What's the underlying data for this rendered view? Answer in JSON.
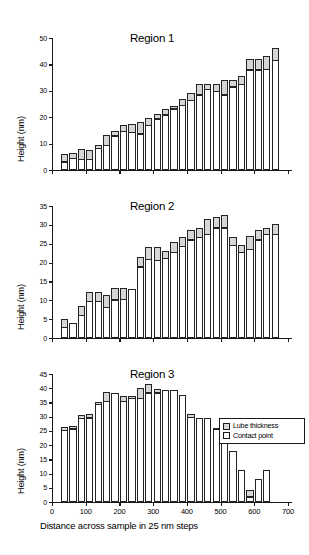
{
  "figure": {
    "xtitle": "Distance across sample in 25 nm steps",
    "ytitle": "Height (nm)",
    "legend": {
      "items": [
        {
          "label": "Lube thickness",
          "color": "#d6d6d6"
        },
        {
          "label": "Contact point",
          "color": "#ffffff"
        }
      ]
    }
  },
  "chart_data": [
    {
      "type": "bar",
      "title": "Region 1",
      "xlabel": "Distance across sample in 25 nm steps",
      "ylabel": "Height (nm)",
      "xlim": [
        0,
        700
      ],
      "ylim": [
        0,
        50
      ],
      "yticks": [
        0,
        10,
        20,
        30,
        40,
        50
      ],
      "xticks": [
        0,
        100,
        200,
        300,
        400,
        500,
        600,
        700
      ],
      "grid": false,
      "stacked": true,
      "legend_position": "none",
      "x": [
        37,
        62,
        87,
        112,
        137,
        162,
        187,
        212,
        237,
        262,
        287,
        312,
        337,
        362,
        387,
        412,
        437,
        462,
        487,
        512,
        537,
        562,
        587,
        612,
        637,
        662
      ],
      "series": [
        {
          "name": "Contact point",
          "values": [
            3.2,
            4.5,
            4.2,
            4.2,
            8.3,
            9.5,
            13.0,
            14.8,
            14.3,
            13.8,
            17.0,
            19.5,
            21.0,
            23.2,
            24.5,
            26.5,
            28.5,
            30.5,
            29.8,
            28.5,
            31.5,
            32.5,
            38.0,
            38.0,
            38.2,
            41.5
          ]
        },
        {
          "name": "Lube thickness",
          "values": [
            2.6,
            1.6,
            3.4,
            3.3,
            1.0,
            3.5,
            1.5,
            2.2,
            2.8,
            4.2,
            2.5,
            1.5,
            1.8,
            0.8,
            2.2,
            2.3,
            4.0,
            2.0,
            2.7,
            5.4,
            2.5,
            3.0,
            4.0,
            4.0,
            4.9,
            4.6
          ]
        }
      ],
      "totals": [
        5.8,
        6.1,
        7.6,
        7.5,
        9.3,
        13.0,
        14.5,
        17.0,
        17.1,
        18.0,
        19.5,
        21.0,
        22.8,
        24.0,
        26.7,
        28.8,
        32.5,
        32.5,
        32.5,
        33.9,
        34.0,
        35.5,
        42.0,
        42.0,
        43.1,
        46.1
      ]
    },
    {
      "type": "bar",
      "title": "Region 2",
      "xlabel": "Distance across sample in 25 nm steps",
      "ylabel": "Height (nm)",
      "xlim": [
        0,
        700
      ],
      "ylim": [
        0,
        35
      ],
      "yticks": [
        0,
        5,
        10,
        15,
        20,
        25,
        30,
        35
      ],
      "xticks": [
        0,
        100,
        200,
        300,
        400,
        500,
        600,
        700
      ],
      "grid": false,
      "stacked": true,
      "legend_position": "none",
      "x": [
        37,
        62,
        87,
        112,
        137,
        162,
        187,
        212,
        237,
        262,
        287,
        312,
        337,
        362,
        387,
        412,
        437,
        462,
        487,
        512,
        537,
        562,
        587,
        612,
        637,
        662
      ],
      "series": [
        {
          "name": "Contact point",
          "values": [
            2.9,
            4.0,
            6.0,
            9.8,
            9.7,
            8.2,
            10.2,
            10.3,
            13.0,
            18.9,
            20.9,
            20.6,
            21.2,
            22.8,
            24.3,
            26.1,
            26.7,
            27.5,
            29.2,
            29.2,
            24.6,
            22.8,
            23.5,
            26.1,
            27.6,
            27.6
          ]
        },
        {
          "name": "Lube thickness",
          "values": [
            2.1,
            0.0,
            2.4,
            2.2,
            2.4,
            3.0,
            2.8,
            2.7,
            0.0,
            2.5,
            3.2,
            3.5,
            1.6,
            2.5,
            2.4,
            2.4,
            2.2,
            3.8,
            2.6,
            3.2,
            2.1,
            1.6,
            3.5,
            2.5,
            1.3,
            2.6
          ]
        }
      ],
      "totals": [
        5.0,
        4.0,
        8.4,
        12.0,
        12.1,
        11.2,
        13.0,
        13.0,
        13.0,
        21.4,
        24.1,
        24.1,
        22.8,
        25.3,
        26.7,
        28.5,
        28.9,
        31.3,
        31.8,
        32.4,
        26.7,
        24.4,
        27.0,
        28.6,
        28.9,
        30.2
      ]
    },
    {
      "type": "bar",
      "title": "Region 3",
      "xlabel": "Distance across sample in 25 nm steps",
      "ylabel": "Height (nm)",
      "xlim": [
        0,
        700
      ],
      "ylim": [
        0,
        45
      ],
      "yticks": [
        0,
        5,
        10,
        15,
        20,
        25,
        30,
        35,
        40,
        45
      ],
      "xticks": [
        0,
        100,
        200,
        300,
        400,
        500,
        600,
        700
      ],
      "grid": false,
      "stacked": true,
      "legend_position": "upper right",
      "x": [
        37,
        62,
        87,
        112,
        137,
        162,
        187,
        212,
        237,
        262,
        287,
        312,
        337,
        362,
        387,
        412,
        437,
        462,
        487,
        512,
        537,
        562,
        587,
        612,
        637
      ],
      "series": [
        {
          "name": "Contact point",
          "values": [
            25.3,
            25.8,
            29.4,
            29.6,
            34.3,
            35.5,
            38.4,
            35.4,
            36.6,
            36.4,
            38.5,
            38.4,
            39.5,
            39.5,
            37.5,
            29.9,
            29.6,
            29.4,
            25.5,
            23.5,
            17.9,
            11.4,
            1.8,
            8.2,
            11.2
          ]
        },
        {
          "name": "Lube thickness",
          "values": [
            1.0,
            0.7,
            0.9,
            1.2,
            0.6,
            3.0,
            0.0,
            1.5,
            0.5,
            3.3,
            2.9,
            1.2,
            0.0,
            0.0,
            0.0,
            1.0,
            0.0,
            0.0,
            0.3,
            0.2,
            0.0,
            0.0,
            2.2,
            0.0,
            0.0
          ]
        }
      ],
      "totals": [
        26.3,
        26.5,
        30.3,
        30.8,
        34.9,
        38.5,
        38.4,
        36.9,
        37.1,
        39.7,
        41.4,
        39.6,
        39.5,
        39.5,
        37.5,
        30.9,
        29.6,
        29.4,
        25.8,
        23.7,
        17.9,
        11.4,
        4.0,
        8.2,
        11.2
      ]
    }
  ]
}
